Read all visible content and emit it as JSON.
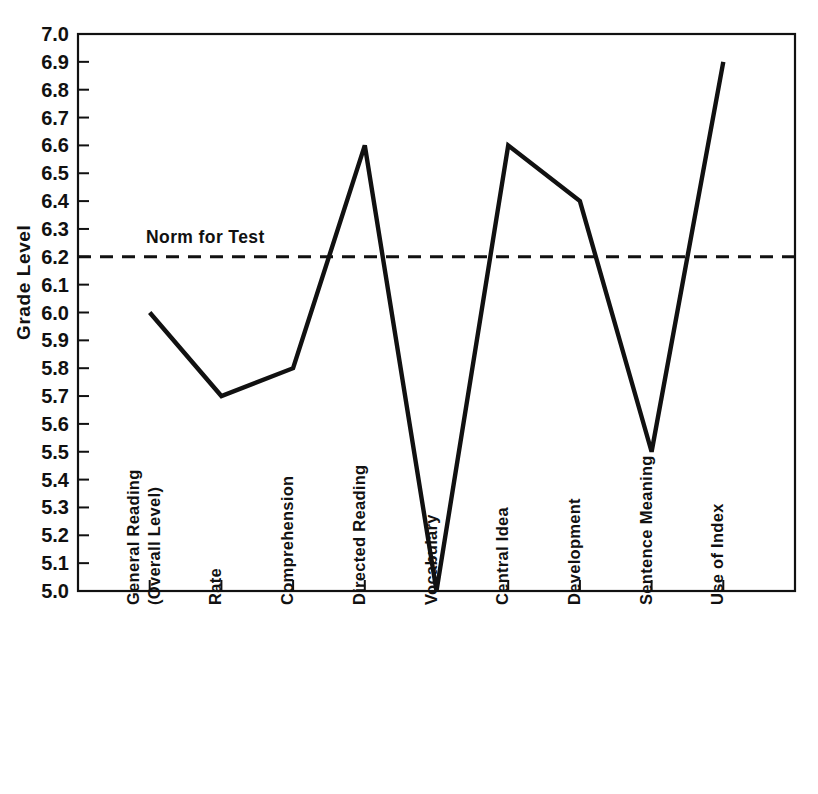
{
  "chart_data": {
    "type": "line",
    "title": "",
    "xlabel": "",
    "ylabel": "Grade Level",
    "ylim": [
      5.0,
      7.0
    ],
    "ytick_step": 0.1,
    "grid": false,
    "legend_position": "none",
    "categories": [
      "General Reading (Overall Level)",
      "Rate",
      "Comprehension",
      "Directed Reading",
      "Vocabulary",
      "Central Idea",
      "Development",
      "Sentence Meaning",
      "Use of Index"
    ],
    "category_lines": [
      [
        "General Reading",
        "(Overall Level)"
      ],
      [
        "Rate"
      ],
      [
        "Comprehension"
      ],
      [
        "Directed Reading"
      ],
      [
        "Vocabulary"
      ],
      [
        "Central Idea"
      ],
      [
        "Development"
      ],
      [
        "Sentence Meaning"
      ],
      [
        "Use of Index"
      ]
    ],
    "values": [
      6.0,
      5.7,
      5.8,
      6.6,
      5.0,
      6.6,
      6.4,
      5.5,
      6.9
    ],
    "ytick_labels": [
      "7.0",
      "6.9",
      "6.8",
      "6.7",
      "6.6",
      "6.5",
      "6.4",
      "6.3",
      "6.2",
      "6.1",
      "6.0",
      "5.9",
      "5.8",
      "5.7",
      "5.6",
      "5.5",
      "5.4",
      "5.3",
      "5.2",
      "5.1",
      "5.0"
    ],
    "ytick_values": [
      7.0,
      6.9,
      6.8,
      6.7,
      6.6,
      6.5,
      6.4,
      6.3,
      6.2,
      6.1,
      6.0,
      5.9,
      5.8,
      5.7,
      5.6,
      5.5,
      5.4,
      5.3,
      5.2,
      5.1,
      5.0
    ],
    "annotations": [
      {
        "name": "norm-for-test",
        "label": "Norm for Test",
        "value": 6.2,
        "style": "dashed-horizontal-line"
      }
    ],
    "colors": {
      "line": "#111111",
      "norm_line": "#111111",
      "axis": "#111111",
      "background": "#ffffff"
    }
  }
}
